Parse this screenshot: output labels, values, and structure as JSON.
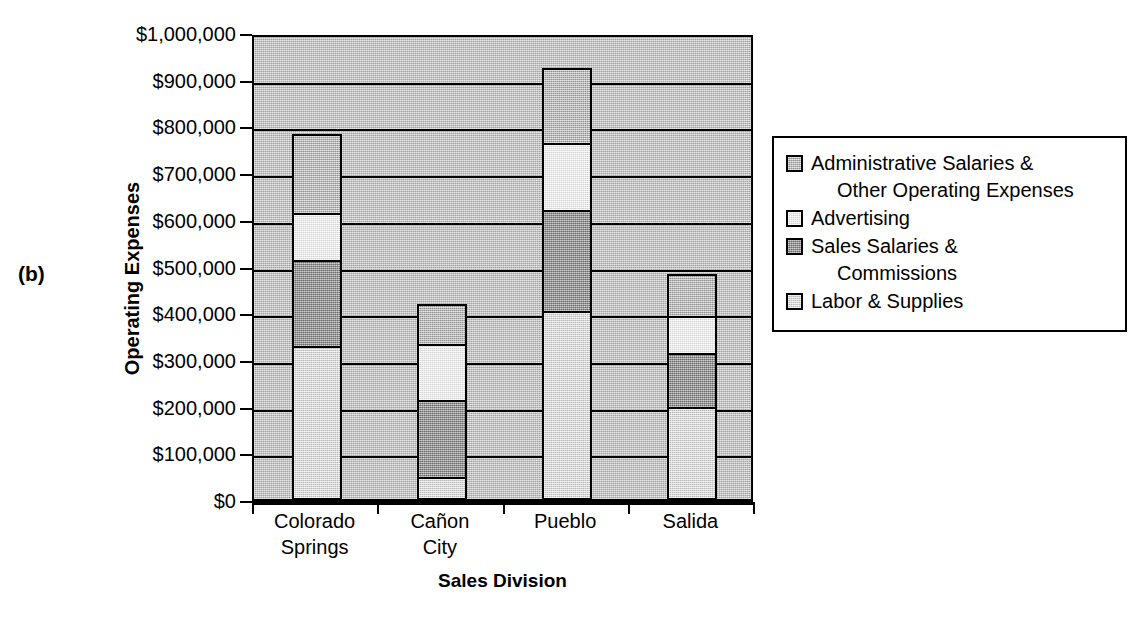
{
  "panel": {
    "label": "(b)"
  },
  "axes": {
    "y_title": "Operating Expenses",
    "x_title": "Sales Division",
    "y_ticks": [
      "$1,000,000",
      "$900,000",
      "$800,000",
      "$700,000",
      "$600,000",
      "$500,000",
      "$400,000",
      "$300,000",
      "$200,000",
      "$100,000",
      "$0"
    ]
  },
  "legend": {
    "items": [
      {
        "label_line1": "Administrative Salaries &",
        "label_line2": "Other Operating Expenses",
        "swatch": "admin",
        "color": "#c8c8c8"
      },
      {
        "label_line1": "Advertising",
        "label_line2": "",
        "swatch": "advertising",
        "color": "#f2f2f2"
      },
      {
        "label_line1": "Sales Salaries &",
        "label_line2": "Commissions",
        "swatch": "sales",
        "color": "#b0b0b0"
      },
      {
        "label_line1": "Labor & Supplies",
        "label_line2": "",
        "swatch": "labor",
        "color": "#e4e4e4"
      }
    ]
  },
  "chart_data": {
    "type": "bar",
    "title": "",
    "xlabel": "Sales Division",
    "ylabel": "Operating Expenses",
    "stacked": true,
    "grid": true,
    "legend_position": "right",
    "ylim": [
      0,
      1000000
    ],
    "ytick_step": 100000,
    "ytick_labels": [
      "$0",
      "$100,000",
      "$200,000",
      "$300,000",
      "$400,000",
      "$500,000",
      "$600,000",
      "$700,000",
      "$800,000",
      "$900,000",
      "$1,000,000"
    ],
    "categories": [
      "Colorado Springs",
      "Cañon City",
      "Pueblo",
      "Salida"
    ],
    "category_labels_wrapped": [
      [
        "Colorado",
        "Springs"
      ],
      [
        "Cañon",
        "City"
      ],
      [
        "Pueblo",
        ""
      ],
      [
        "Salida",
        ""
      ]
    ],
    "series": [
      {
        "name": "Labor & Supplies",
        "values": [
          325000,
          45000,
          400000,
          195000
        ]
      },
      {
        "name": "Sales Salaries & Commissions",
        "values": [
          185000,
          165000,
          217000,
          115000
        ]
      },
      {
        "name": "Advertising",
        "values": [
          100000,
          120000,
          143000,
          80000
        ]
      },
      {
        "name": "Administrative Salaries & Other Operating Expenses",
        "values": [
          170000,
          85000,
          160000,
          90000
        ]
      }
    ],
    "totals": [
      780000,
      415000,
      920000,
      480000
    ]
  }
}
